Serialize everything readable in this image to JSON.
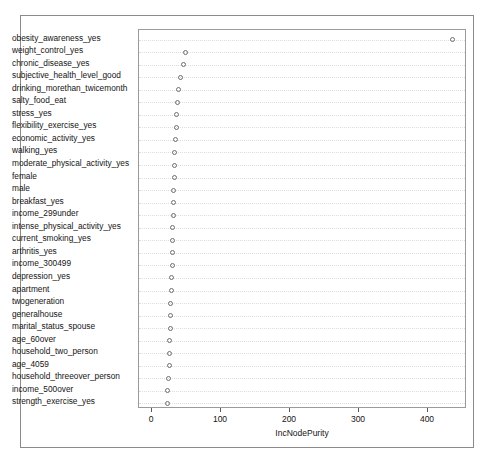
{
  "chart_data": {
    "type": "scatter",
    "subtype": "dotchart",
    "title": "",
    "xlabel": "IncNodePurity",
    "ylabel": "",
    "xlim": [
      0,
      450
    ],
    "ylim": [
      0,
      29
    ],
    "grid": true,
    "legend": null,
    "xticks": [
      0,
      100,
      200,
      300,
      400
    ],
    "xticklabels": [
      "0",
      "100",
      "200",
      "300",
      "400"
    ],
    "categories": [
      "obesity_awareness_yes",
      "weight_control_yes",
      "chronic_disease_yes",
      "subjective_health_level_good",
      "drinking_morethan_twicemonth",
      "salty_food_eat",
      "stress_yes",
      "flexibility_exercise_yes",
      "economic_activity_yes",
      "walking_yes",
      "moderate_physical_activity_yes",
      "female",
      "male",
      "breakfast_yes",
      "income_299under",
      "intense_physical_activity_yes",
      "current_smoking_yes",
      "arthritis_yes",
      "income_300499",
      "depression_yes",
      "apartment",
      "twogeneration",
      "generalhouse",
      "marital_status_spouse",
      "age_60over",
      "household_two_person",
      "age_4059",
      "household_threeover_person",
      "income_500over",
      "strength_exercise_yes"
    ],
    "values": [
      436,
      49,
      46,
      41,
      38,
      37,
      36,
      35,
      34,
      33,
      32,
      32,
      31,
      31,
      31,
      30,
      30,
      29,
      29,
      28,
      28,
      27,
      27,
      27,
      26,
      26,
      25,
      24,
      23,
      22
    ],
    "marker": "open-circle",
    "marker_color": "#6e6e6e"
  },
  "axis": {
    "x_title": "IncNodePurity"
  }
}
